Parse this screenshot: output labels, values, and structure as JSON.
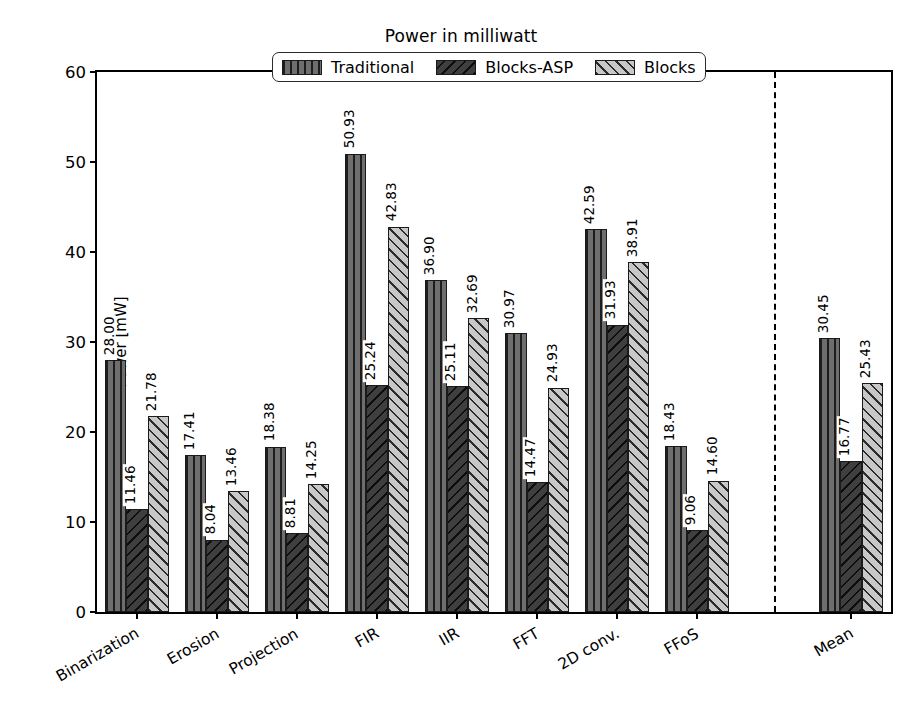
{
  "chart_data": {
    "type": "bar",
    "title": "Power in milliwatt",
    "xlabel": "",
    "ylabel": "Power [mW]",
    "ylim": [
      0,
      60
    ],
    "yticks": [
      0,
      10,
      20,
      30,
      40,
      50,
      60
    ],
    "grid": false,
    "legend_position": "upper center",
    "categories": [
      "Binarization",
      "Erosion",
      "Projection",
      "FIR",
      "IIR",
      "FFT",
      "2D conv.",
      "FFoS",
      "Mean"
    ],
    "series": [
      {
        "name": "Traditional",
        "color": "#6e6e6e",
        "hatch": "vertical",
        "values": [
          28.0,
          17.41,
          18.38,
          50.93,
          36.9,
          30.97,
          42.59,
          18.43,
          30.45
        ],
        "labels": [
          "28.00",
          "17.41",
          "18.38",
          "50.93",
          "36.90",
          "30.97",
          "42.59",
          "18.43",
          "30.45"
        ]
      },
      {
        "name": "Blocks-ASP",
        "color": "#3f3f3f",
        "hatch": "back-diagonal",
        "values": [
          11.46,
          8.04,
          8.81,
          25.24,
          25.11,
          14.47,
          31.93,
          9.06,
          16.77
        ],
        "labels": [
          "11.46",
          "8.04",
          "8.81",
          "25.24",
          "25.11",
          "14.47",
          "31.93",
          "9.06",
          "16.77"
        ]
      },
      {
        "name": "Blocks",
        "color": "#c8c8c8",
        "hatch": "forward-diagonal",
        "values": [
          21.78,
          13.46,
          14.25,
          42.83,
          32.69,
          24.93,
          38.91,
          14.6,
          25.43
        ],
        "labels": [
          "21.78",
          "13.46",
          "14.25",
          "42.83",
          "32.69",
          "24.93",
          "38.91",
          "14.60",
          "25.43"
        ]
      }
    ],
    "separator_after_category": "FFoS",
    "separator_style": "dashed-vertical"
  }
}
